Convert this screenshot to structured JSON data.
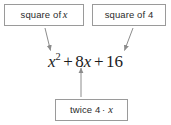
{
  "diagram": {
    "background_color": "#ffffff",
    "box_border_color": "#9a9a9a",
    "text_color": "#2b2b2b",
    "arrow_color": "#8c8c8c",
    "equation_color": "#1c1c1c"
  },
  "boxes": {
    "square_of_x": {
      "label_prefix": "square of",
      "label_variable": "x"
    },
    "square_of_4": {
      "label": "square of 4"
    },
    "twice_4x": {
      "label_prefix": "twice 4",
      "label_dot": "·",
      "label_variable": "x"
    }
  },
  "equation": {
    "full_text": "x² + 8x + 16",
    "term1_base": "x",
    "term1_exponent": "2",
    "operator1": "+",
    "term2_coefficient": "8",
    "term2_variable": "x",
    "operator2": "+",
    "term3": "16"
  },
  "arrows": [
    {
      "name": "arrow-square-of-x-to-x-squared",
      "from": "square of x",
      "to": "x²",
      "direction": "down-right"
    },
    {
      "name": "arrow-square-of-4-to-16",
      "from": "square of 4",
      "to": "16",
      "direction": "down-left"
    },
    {
      "name": "arrow-twice-4x-to-8x",
      "from": "twice 4 · x",
      "to": "8x",
      "direction": "up"
    }
  ]
}
